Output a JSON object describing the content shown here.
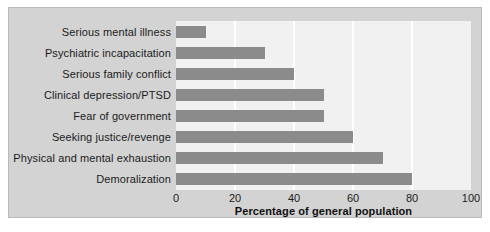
{
  "chart_data": {
    "type": "bar",
    "orientation": "horizontal",
    "title": "",
    "xlabel": "Percentage of general population",
    "ylabel": "",
    "xlim": [
      0,
      100
    ],
    "xticks": [
      0,
      20,
      40,
      60,
      80,
      100
    ],
    "grid": true,
    "legend": null,
    "categories": [
      "Serious mental illness",
      "Psychiatric incapacitation",
      "Serious family conflict",
      "Clinical depression/PTSD",
      "Fear of government",
      "Seeking justice/revenge",
      "Physical and mental exhaustion",
      "Demoralization"
    ],
    "values": [
      10,
      30,
      40,
      50,
      50,
      60,
      70,
      80
    ],
    "colors": {
      "bar": "#8b8b8b",
      "plot_background": "#f1f1f1",
      "figure_background": "#d3d3d3",
      "gridline": "#ffffff",
      "text": "#1b1b1b"
    }
  }
}
